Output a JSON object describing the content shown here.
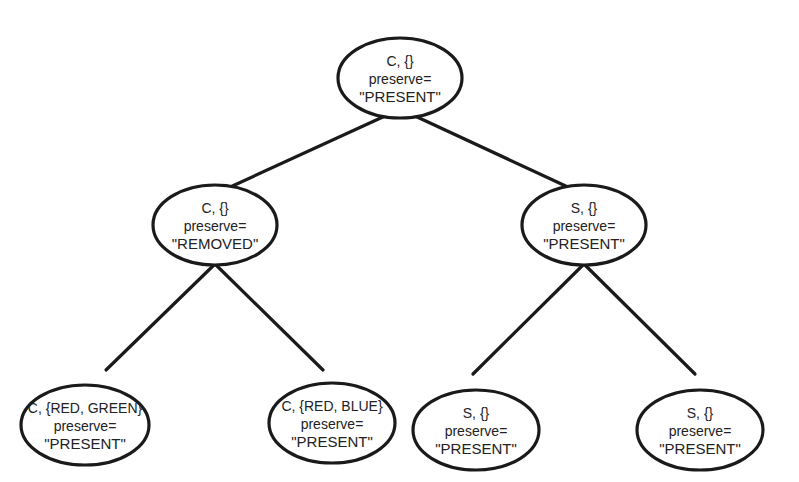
{
  "diagram": {
    "type": "tree",
    "colors": {
      "stroke": "#1a1a1a",
      "text": "#222222",
      "background": "#ffffff"
    },
    "nodes": [
      {
        "id": "root",
        "cx": 400,
        "cy": 78,
        "rx": 62,
        "ry": 40,
        "line1": "C, {}",
        "line2": "preserve=",
        "line3": "\"PRESENT\""
      },
      {
        "id": "left",
        "cx": 215,
        "cy": 225,
        "rx": 62,
        "ry": 40,
        "line1": "C, {}",
        "line2": "preserve=",
        "line3": "\"REMOVED\""
      },
      {
        "id": "right",
        "cx": 584,
        "cy": 225,
        "rx": 62,
        "ry": 40,
        "line1": "S, {}",
        "line2": "preserve=",
        "line3": "\"PRESENT\""
      },
      {
        "id": "left-left",
        "cx": 85,
        "cy": 425,
        "rx": 64,
        "ry": 40,
        "line1": "C, {RED, GREEN}",
        "line2": "preserve=",
        "line3": "\"PRESENT\""
      },
      {
        "id": "left-right",
        "cx": 332,
        "cy": 423,
        "rx": 63,
        "ry": 40,
        "line1": "C, {RED, BLUE}",
        "line2": "preserve=",
        "line3": "\"PRESENT\""
      },
      {
        "id": "right-left",
        "cx": 476,
        "cy": 430,
        "rx": 63,
        "ry": 40,
        "line1": "S, {}",
        "line2": "preserve=",
        "line3": "\"PRESENT\""
      },
      {
        "id": "right-right",
        "cx": 700,
        "cy": 430,
        "rx": 63,
        "ry": 40,
        "line1": "S, {}",
        "line2": "preserve=",
        "line3": "\"PRESENT\""
      }
    ],
    "edges": [
      {
        "from": "root",
        "to": "left",
        "x1": 385,
        "y1": 116,
        "x2": 228,
        "y2": 188
      },
      {
        "from": "root",
        "to": "right",
        "x1": 415,
        "y1": 116,
        "x2": 570,
        "y2": 188
      },
      {
        "from": "left",
        "to": "left-left",
        "x1": 215,
        "y1": 264,
        "x2": 106,
        "y2": 370
      },
      {
        "from": "left",
        "to": "left-right",
        "x1": 215,
        "y1": 264,
        "x2": 323,
        "y2": 370
      },
      {
        "from": "right",
        "to": "right-left",
        "x1": 584,
        "y1": 264,
        "x2": 473,
        "y2": 374
      },
      {
        "from": "right",
        "to": "right-right",
        "x1": 584,
        "y1": 264,
        "x2": 695,
        "y2": 374
      }
    ]
  }
}
